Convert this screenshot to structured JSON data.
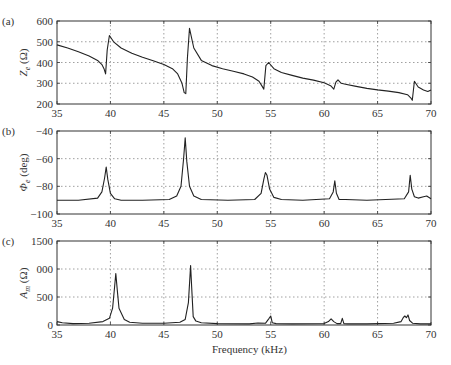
{
  "chart_data": [
    {
      "type": "line",
      "panel_label": "(a)",
      "ylabel": "Z_e (Ω)",
      "ylabel_main": "Z",
      "ylabel_sub": "e",
      "ylabel_unit": " (Ω)",
      "xlabel": "",
      "xlim": [
        35,
        70
      ],
      "ylim": [
        200,
        600
      ],
      "xticks": [
        "35",
        "40",
        "45",
        "50",
        "55",
        "60",
        "65",
        "70"
      ],
      "yticks": [
        "600",
        "500",
        "400",
        "300",
        "200"
      ],
      "grid": true,
      "series": [
        {
          "name": "Z_e",
          "x": [
            35,
            36,
            37,
            38,
            38.8,
            39.2,
            39.4,
            39.55,
            39.7,
            39.9,
            40.3,
            41,
            42,
            43,
            44,
            45,
            45.8,
            46.3,
            46.7,
            46.9,
            47.05,
            47.2,
            47.4,
            47.8,
            48.5,
            49.5,
            50.5,
            51.5,
            52.5,
            53.3,
            53.9,
            54.2,
            54.35,
            54.55,
            54.8,
            55.3,
            56,
            57,
            58,
            59,
            60,
            60.6,
            60.9,
            61.1,
            61.3,
            61.6,
            62,
            63,
            64,
            65,
            66,
            67,
            67.8,
            68.1,
            68.25,
            68.45,
            68.8,
            69.3,
            69.7,
            70
          ],
          "values": [
            485,
            470,
            452,
            432,
            410,
            390,
            370,
            345,
            460,
            530,
            500,
            470,
            445,
            425,
            408,
            390,
            370,
            345,
            300,
            255,
            250,
            420,
            565,
            470,
            410,
            385,
            370,
            358,
            345,
            330,
            310,
            285,
            272,
            385,
            400,
            370,
            352,
            338,
            325,
            315,
            302,
            288,
            272,
            305,
            316,
            300,
            295,
            285,
            275,
            268,
            262,
            255,
            245,
            230,
            218,
            310,
            282,
            268,
            260,
            268
          ]
        }
      ]
    },
    {
      "type": "line",
      "panel_label": "(b)",
      "ylabel": "Φ_e (deg)",
      "ylabel_main": "Φ",
      "ylabel_sub": "e",
      "ylabel_unit": " (deg)",
      "xlabel": "",
      "xlim": [
        35,
        70
      ],
      "ylim": [
        -100,
        -40
      ],
      "xticks": [
        "35",
        "40",
        "45",
        "50",
        "55",
        "60",
        "65",
        "70"
      ],
      "yticks": [
        "-40",
        "-60",
        "-80",
        "-100"
      ],
      "grid": true,
      "series": [
        {
          "name": "Φ_e",
          "x": [
            35,
            37,
            38.8,
            39.2,
            39.45,
            39.6,
            39.75,
            40.0,
            40.4,
            41,
            43,
            45.5,
            46.2,
            46.6,
            46.85,
            47.0,
            47.15,
            47.4,
            47.8,
            48.5,
            51,
            53.5,
            54.1,
            54.35,
            54.5,
            54.65,
            54.9,
            55.3,
            56,
            58,
            60.5,
            60.85,
            61.0,
            61.15,
            61.4,
            62,
            64,
            67.5,
            67.9,
            68.05,
            68.2,
            68.45,
            68.8,
            69.3,
            69.6,
            70
          ],
          "values": [
            -90,
            -90,
            -88.5,
            -84,
            -74,
            -66,
            -75,
            -85,
            -89,
            -90,
            -90,
            -89.5,
            -87,
            -80,
            -60,
            -45,
            -62,
            -80,
            -87,
            -89.5,
            -90,
            -89.5,
            -85,
            -75,
            -70,
            -72,
            -82,
            -88,
            -89.5,
            -90,
            -89,
            -84,
            -76,
            -85,
            -89.5,
            -89.5,
            -90,
            -89,
            -84,
            -72,
            -82,
            -87.5,
            -88.5,
            -87.5,
            -87,
            -89
          ]
        }
      ]
    },
    {
      "type": "line",
      "panel_label": "(c)",
      "ylabel": "A_m (Ω)",
      "ylabel_main": "A",
      "ylabel_sub": "m",
      "ylabel_unit": " (Ω)",
      "xlabel": "Frequency (kHz)",
      "xlim": [
        35,
        70
      ],
      "ylim": [
        0,
        1500
      ],
      "xticks": [
        "35",
        "40",
        "45",
        "50",
        "55",
        "60",
        "65",
        "70"
      ],
      "yticks": [
        "1500",
        "1000",
        "500",
        "0"
      ],
      "ytick_display": [
        "1500",
        "000",
        "500",
        "0"
      ],
      "grid": true,
      "series": [
        {
          "name": "A_m",
          "x": [
            35,
            35.5,
            36.5,
            38,
            39.3,
            39.9,
            40.2,
            40.4,
            40.5,
            40.65,
            40.8,
            41.0,
            41.3,
            41.8,
            43,
            45,
            46.5,
            47.0,
            47.3,
            47.5,
            47.6,
            47.75,
            48.0,
            48.5,
            50,
            53,
            53.8,
            54.5,
            54.85,
            55.0,
            55.15,
            55.5,
            57,
            60,
            60.4,
            60.65,
            60.9,
            61.2,
            61.55,
            61.7,
            61.85,
            62.2,
            64,
            66.5,
            67.2,
            67.4,
            67.55,
            67.7,
            67.85,
            68.0,
            68.3,
            69,
            70
          ],
          "values": [
            60,
            40,
            25,
            30,
            60,
            120,
            300,
            700,
            920,
            600,
            300,
            220,
            100,
            50,
            30,
            30,
            50,
            100,
            400,
            1060,
            700,
            150,
            70,
            40,
            25,
            20,
            35,
            30,
            120,
            160,
            40,
            25,
            20,
            25,
            60,
            110,
            60,
            25,
            25,
            120,
            25,
            20,
            20,
            30,
            60,
            130,
            160,
            130,
            180,
            80,
            30,
            20,
            20
          ]
        }
      ]
    }
  ],
  "figure": {
    "xlabel": "Frequency (kHz)",
    "panels": [
      "(a)",
      "(b)",
      "(c)"
    ]
  }
}
